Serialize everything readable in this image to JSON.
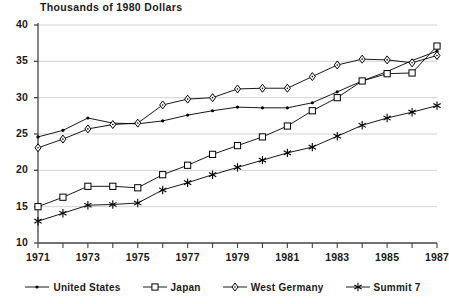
{
  "chart_data": {
    "type": "line",
    "title": "Thousands of 1980 Dollars",
    "xlabel": "",
    "ylabel": "",
    "xlim": [
      1971,
      1987
    ],
    "ylim": [
      10,
      40
    ],
    "ytick_values": [
      40,
      35,
      30,
      25,
      20,
      15,
      10
    ],
    "ytick_labels": [
      "40",
      "35",
      "30",
      "25",
      "20",
      "15",
      "10"
    ],
    "xtick_values": [
      1971,
      1972,
      1973,
      1974,
      1975,
      1976,
      1977,
      1978,
      1979,
      1980,
      1981,
      1982,
      1983,
      1984,
      1985,
      1986,
      1987
    ],
    "xtick_labels": [
      "1971",
      "1973",
      "1975",
      "1977",
      "1979",
      "1981",
      "1983",
      "1985",
      "1987"
    ],
    "xtick_labeled_values": [
      1971,
      1973,
      1975,
      1977,
      1979,
      1981,
      1983,
      1985,
      1987
    ],
    "grid": "horizontal",
    "legend_position": "bottom",
    "x": [
      1971,
      1972,
      1973,
      1974,
      1975,
      1976,
      1977,
      1978,
      1979,
      1980,
      1981,
      1982,
      1983,
      1984,
      1985,
      1986,
      1987
    ],
    "series": [
      {
        "name": "United States",
        "marker": "dot",
        "color": "#000000",
        "values": [
          24.6,
          25.5,
          27.2,
          26.5,
          26.4,
          26.8,
          27.6,
          28.2,
          28.7,
          28.6,
          28.6,
          29.3,
          30.8,
          32.3,
          33.6,
          35.1,
          36.4
        ]
      },
      {
        "name": "Japan",
        "marker": "square",
        "color": "#000000",
        "values": [
          15.0,
          16.3,
          17.8,
          17.8,
          17.6,
          19.4,
          20.7,
          22.2,
          23.4,
          24.6,
          26.1,
          28.2,
          30.0,
          32.3,
          33.3,
          33.4,
          37.1
        ]
      },
      {
        "name": "West Germany",
        "marker": "diamond",
        "color": "#000000",
        "values": [
          23.1,
          24.3,
          25.7,
          26.3,
          26.5,
          29.0,
          29.8,
          30.0,
          31.2,
          31.3,
          31.3,
          32.9,
          34.5,
          35.3,
          35.2,
          34.8,
          35.8
        ]
      },
      {
        "name": "Summit 7",
        "marker": "asterisk",
        "color": "#000000",
        "values": [
          13.0,
          14.1,
          15.2,
          15.3,
          15.5,
          17.3,
          18.3,
          19.4,
          20.4,
          21.4,
          22.4,
          23.2,
          24.7,
          26.2,
          27.2,
          28.0,
          28.9
        ]
      }
    ]
  },
  "axes": {
    "axis_color": "#444444",
    "grid_color": "#c8c8c8"
  }
}
